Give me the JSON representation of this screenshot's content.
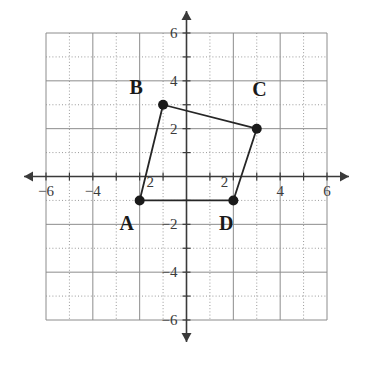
{
  "figure": {
    "title": "",
    "background_color": "#ffffff"
  },
  "chart_data": {
    "type": "scatter",
    "title": "",
    "xlabel": "",
    "ylabel": "",
    "xlim": [
      -6,
      6
    ],
    "ylim": [
      -6,
      6
    ],
    "grid": true,
    "grid_step": 1,
    "grid_major_step": 2,
    "axis_arrows": true,
    "xticks": [
      -6,
      -4,
      4,
      6
    ],
    "xtick_labels": [
      "−6",
      "−4",
      "4",
      "6"
    ],
    "yticks": [
      6,
      4,
      2,
      -2,
      -4,
      -6
    ],
    "ytick_labels": [
      "6",
      "4",
      "2",
      "−2",
      "−4",
      "−6"
    ],
    "inline_labels": [
      {
        "text": "2",
        "x": -1.55,
        "y": -0.45
      },
      {
        "text": "2",
        "x": 1.62,
        "y": -0.45
      }
    ],
    "points": [
      {
        "name": "A",
        "x": -2,
        "y": -1,
        "label": "A",
        "label_dx": -0.55,
        "label_dy": -1.25
      },
      {
        "name": "B",
        "x": -1,
        "y": 3,
        "label": "B",
        "label_dx": -1.15,
        "label_dy": 0.45
      },
      {
        "name": "C",
        "x": 3,
        "y": 2,
        "label": "C",
        "label_dx": 0.12,
        "label_dy": 1.35
      },
      {
        "name": "D",
        "x": 2,
        "y": -1,
        "label": "D",
        "label_dx": -0.3,
        "label_dy": -1.25
      }
    ],
    "polygon": [
      "A",
      "B",
      "C",
      "D"
    ],
    "polygon_closed": true,
    "series": [
      {
        "name": "Quadrilateral ABCD",
        "x": [
          -2,
          -1,
          3,
          2
        ],
        "y": [
          -1,
          3,
          2,
          -1
        ]
      }
    ],
    "colors": {
      "point_fill": "#1a1a1a",
      "line": "#262626",
      "grid_solid": "#8c8c8c",
      "grid_dotted": "#9a9a9a",
      "axis": "#3a3a3a",
      "label": "#3a3a3a"
    },
    "point_radius_px": 5,
    "line_width_px": 1.8
  }
}
